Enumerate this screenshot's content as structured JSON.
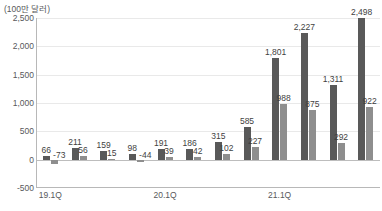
{
  "chart_data": {
    "type": "bar",
    "title": "",
    "unit_label": "(100만 달러)",
    "xlabel": "",
    "ylabel": "",
    "ylim": [
      -500,
      2500
    ],
    "yticks": [
      "2,500",
      "2,000",
      "1,500",
      "1,000",
      "500",
      "0",
      "-500"
    ],
    "ytick_values": [
      2500,
      2000,
      1500,
      1000,
      500,
      0,
      -500
    ],
    "grid": true,
    "legend": "none",
    "categories": [
      "19.1Q",
      "",
      "",
      "",
      "20.1Q",
      "",
      "",
      "",
      "21.1Q",
      "",
      "",
      ""
    ],
    "xtick_labels": [
      "19.1Q",
      "20.1Q",
      "21.1Q"
    ],
    "xtick_indices": [
      0,
      4,
      8
    ],
    "series": [
      {
        "name": "series-1",
        "color": "#595959",
        "values": [
          66,
          211,
          159,
          98,
          191,
          186,
          315,
          585,
          1801,
          2227,
          1311,
          2498
        ],
        "labels": [
          "66",
          "211",
          "159",
          "98",
          "191",
          "186",
          "315",
          "585",
          "1,801",
          "2,227",
          "1,311",
          "2,498"
        ]
      },
      {
        "name": "series-2",
        "color": "#8e8e8e",
        "values": [
          -73,
          56,
          15,
          -44,
          39,
          42,
          102,
          227,
          988,
          875,
          292,
          922
        ],
        "labels": [
          "-73",
          "56",
          "15",
          "-44",
          "39",
          "42",
          "102",
          "227",
          "988",
          "875",
          "292",
          "922"
        ]
      }
    ]
  }
}
